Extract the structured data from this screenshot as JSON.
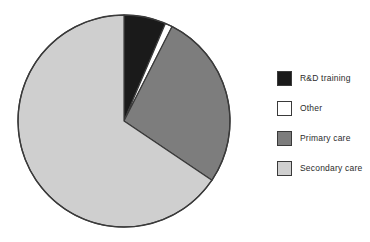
{
  "chart_data": {
    "type": "pie",
    "title": "",
    "categories": [
      "R&D training",
      "Other",
      "Primary care",
      "Secondary care"
    ],
    "values": [
      6.4,
      1.1,
      27.0,
      65.5
    ],
    "units": "percent",
    "colors": [
      "#1a1a1a",
      "#ffffff",
      "#7d7d7d",
      "#cfcfcf"
    ],
    "start_angle_deg": 0,
    "direction": "clockwise",
    "slice_angles_deg": [
      23.0,
      4.0,
      97.0,
      236.0
    ],
    "legend_position": "right",
    "grid": false,
    "xlabel": "",
    "ylabel": "",
    "data_labels_shown": false
  },
  "figure": {
    "background_color": "#ffffff",
    "outline_color": "#3a3a3a"
  },
  "pie": {
    "center_x": 124,
    "center_y": 121,
    "radius": 106,
    "slices": [
      {
        "name": "R&D training",
        "color": "#1a1a1a",
        "value": 6.4,
        "start_deg": 0.0,
        "end_deg": 23.0
      },
      {
        "name": "Other",
        "color": "#ffffff",
        "value": 1.1,
        "start_deg": 23.0,
        "end_deg": 27.0
      },
      {
        "name": "Primary care",
        "color": "#7d7d7d",
        "value": 27.0,
        "start_deg": 27.0,
        "end_deg": 124.0
      },
      {
        "name": "Secondary care",
        "color": "#cfcfcf",
        "value": 65.5,
        "start_deg": 124.0,
        "end_deg": 360.0
      }
    ]
  },
  "legend": {
    "items": [
      {
        "label": "R&D training",
        "color": "#1a1a1a"
      },
      {
        "label": "Other",
        "color": "#ffffff"
      },
      {
        "label": "Primary care",
        "color": "#7d7d7d"
      },
      {
        "label": "Secondary care",
        "color": "#cfcfcf"
      }
    ]
  }
}
